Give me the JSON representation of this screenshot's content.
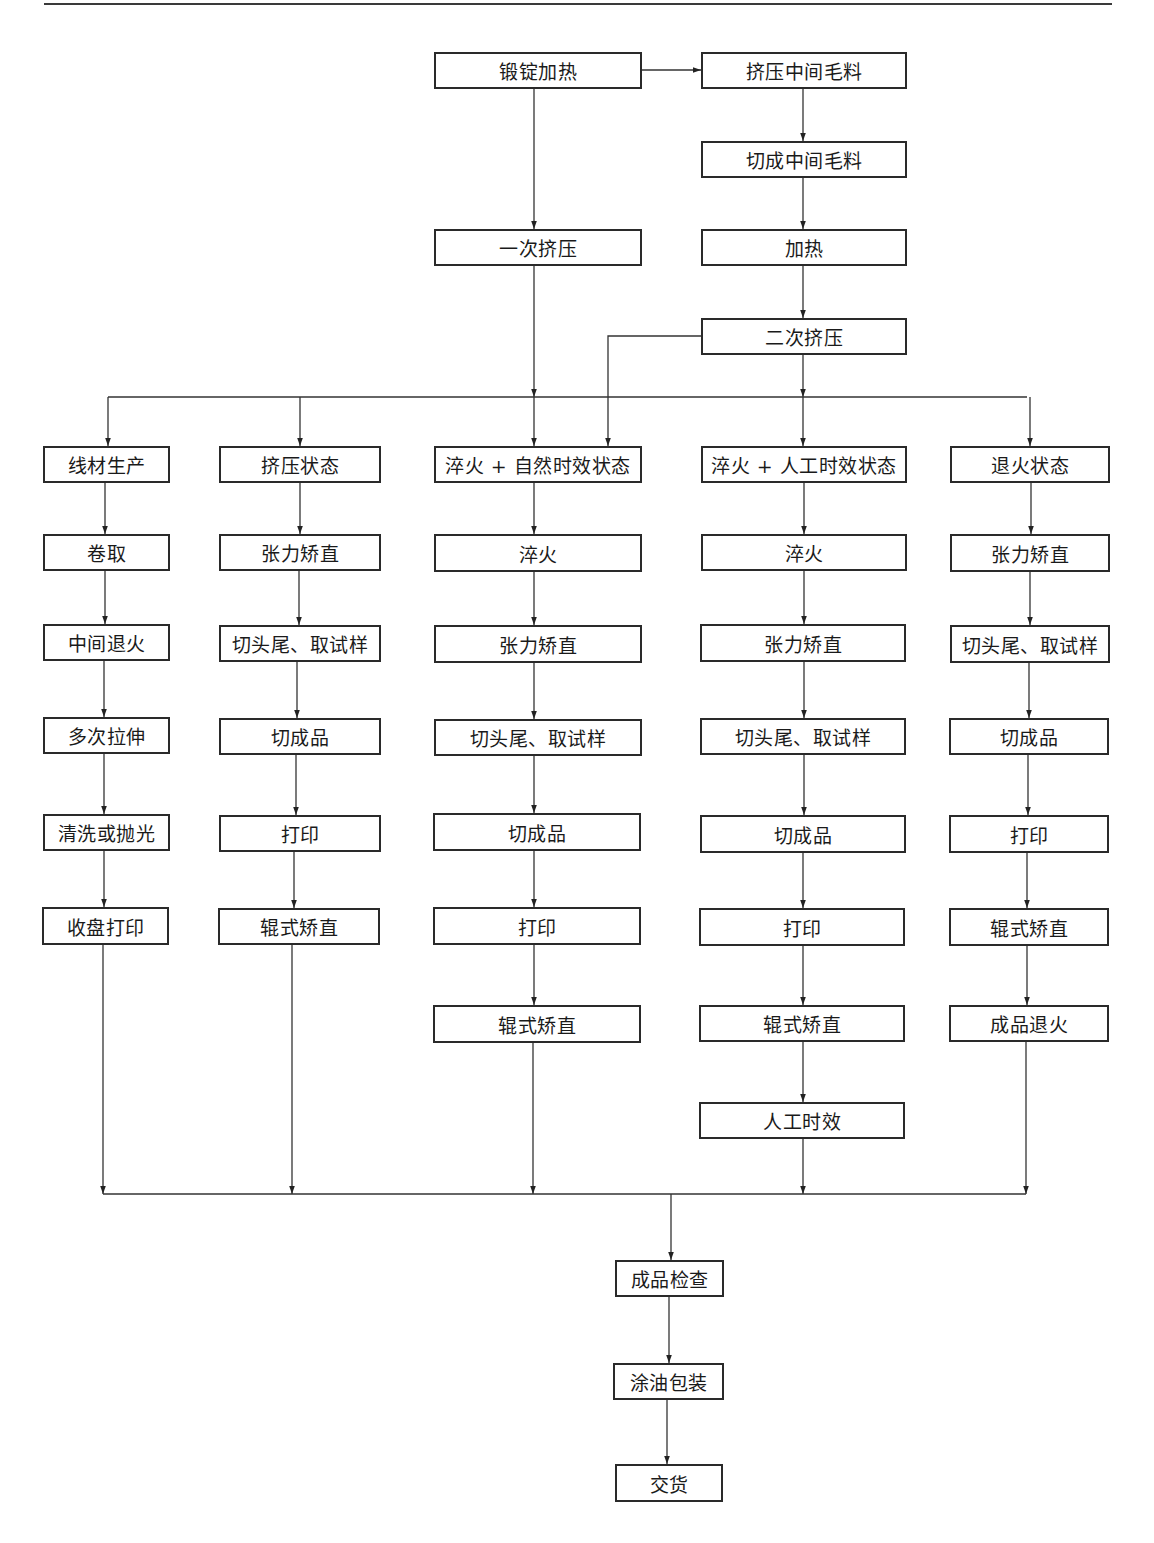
{
  "diagram": {
    "type": "process-flowchart",
    "nodes": {
      "ingot_heating": "锻锭加热",
      "extrude_intermediate": "挤压中间毛料",
      "cut_intermediate": "切成中间毛料",
      "heating": "加热",
      "first_extrusion": "一次挤压",
      "second_extrusion": "二次挤压",
      "branches": [
        {
          "title": "线材生产",
          "steps": [
            "卷取",
            "中间退火",
            "多次拉伸",
            "清洗或抛光",
            "收盘打印"
          ]
        },
        {
          "title": "挤压状态",
          "steps": [
            "张力矫直",
            "切头尾、取试样",
            "切成品",
            "打印",
            "辊式矫直"
          ]
        },
        {
          "title": "淬火 + 自然时效状态",
          "steps": [
            "淬火",
            "张力矫直",
            "切头尾、取试样",
            "切成品",
            "打印",
            "辊式矫直"
          ]
        },
        {
          "title": "淬火 + 人工时效状态",
          "steps": [
            "淬火",
            "张力矫直",
            "切头尾、取试样",
            "切成品",
            "打印",
            "辊式矫直",
            "人工时效"
          ]
        },
        {
          "title": "退火状态",
          "steps": [
            "张力矫直",
            "切头尾、取试样",
            "切成品",
            "打印",
            "辊式矫直",
            "成品退火"
          ]
        }
      ],
      "final_steps": [
        "成品检查",
        "涂油包装",
        "交货"
      ]
    },
    "edges": [
      [
        "锻锭加热",
        "挤压中间毛料"
      ],
      [
        "挤压中间毛料",
        "切成中间毛料"
      ],
      [
        "切成中间毛料",
        "加热"
      ],
      [
        "加热",
        "二次挤压"
      ],
      [
        "锻锭加热",
        "一次挤压"
      ],
      [
        "一次挤压",
        "distribution-bus"
      ],
      [
        "二次挤压",
        "distribution-bus"
      ],
      [
        "二次挤压",
        "淬火 + 自然时效状态"
      ],
      [
        "distribution-bus",
        "线材生产"
      ],
      [
        "distribution-bus",
        "挤压状态"
      ],
      [
        "distribution-bus",
        "淬火 + 自然时效状态"
      ],
      [
        "distribution-bus",
        "淬火 + 人工时效状态"
      ],
      [
        "distribution-bus",
        "退火状态"
      ],
      [
        "all-branch-ends",
        "成品检查"
      ],
      [
        "成品检查",
        "涂油包装"
      ],
      [
        "涂油包装",
        "交货"
      ]
    ]
  }
}
